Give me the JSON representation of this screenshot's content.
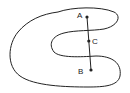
{
  "diagram": {
    "points": [
      {
        "id": "A",
        "label": "A"
      },
      {
        "id": "C",
        "label": "C"
      },
      {
        "id": "B",
        "label": "B"
      }
    ],
    "colors": {
      "stroke": "#222222",
      "background": "#ffffff"
    }
  }
}
